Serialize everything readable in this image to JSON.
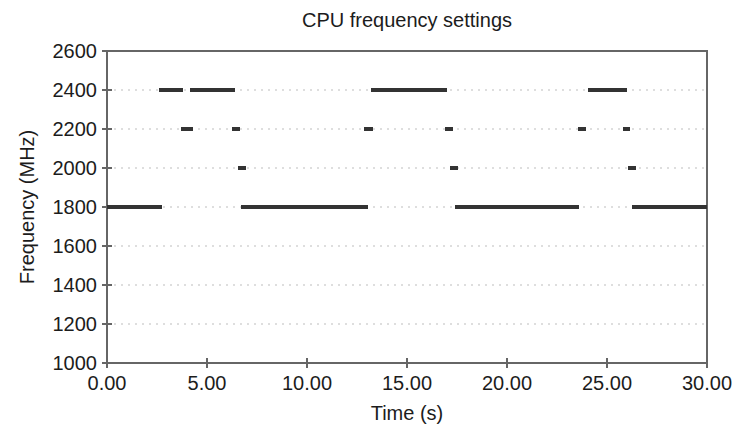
{
  "chart_data": {
    "type": "line",
    "title": "CPU frequency settings",
    "xlabel": "Time (s)",
    "ylabel": "Frequency (MHz)",
    "xlim": [
      0,
      30
    ],
    "ylim": [
      1000,
      2600
    ],
    "x_ticks": [
      0,
      5,
      10,
      15,
      20,
      25,
      30
    ],
    "x_tick_labels": [
      "0.00",
      "5.00",
      "10.00",
      "15.00",
      "20.00",
      "25.00",
      "30.00"
    ],
    "y_ticks": [
      1000,
      1200,
      1400,
      1600,
      1800,
      2000,
      2200,
      2400,
      2600
    ],
    "y_tick_labels": [
      "1000",
      "1200",
      "1400",
      "1600",
      "1800",
      "2000",
      "2200",
      "2400",
      "2600"
    ],
    "grid": true,
    "legend": false,
    "series": [
      {
        "name": "cpu-frequency-trace",
        "style": "horizontal-step-segments",
        "segments": [
          {
            "freq_mhz": 1800,
            "t": [
              0.0,
              2.75
            ]
          },
          {
            "freq_mhz": 2400,
            "t": [
              2.6,
              3.8
            ]
          },
          {
            "freq_mhz": 2200,
            "t": [
              3.7,
              4.3
            ]
          },
          {
            "freq_mhz": 2400,
            "t": [
              4.15,
              6.4
            ]
          },
          {
            "freq_mhz": 2200,
            "t": [
              6.25,
              6.65
            ]
          },
          {
            "freq_mhz": 2000,
            "t": [
              6.55,
              6.95
            ]
          },
          {
            "freq_mhz": 1800,
            "t": [
              6.7,
              13.05
            ]
          },
          {
            "freq_mhz": 2200,
            "t": [
              12.85,
              13.3
            ]
          },
          {
            "freq_mhz": 2400,
            "t": [
              13.2,
              17.0
            ]
          },
          {
            "freq_mhz": 2200,
            "t": [
              16.9,
              17.3
            ]
          },
          {
            "freq_mhz": 2000,
            "t": [
              17.15,
              17.55
            ]
          },
          {
            "freq_mhz": 1800,
            "t": [
              17.4,
              23.6
            ]
          },
          {
            "freq_mhz": 2200,
            "t": [
              23.55,
              23.95
            ]
          },
          {
            "freq_mhz": 2400,
            "t": [
              24.05,
              26.0
            ]
          },
          {
            "freq_mhz": 2200,
            "t": [
              25.8,
              26.15
            ]
          },
          {
            "freq_mhz": 2000,
            "t": [
              26.05,
              26.45
            ]
          },
          {
            "freq_mhz": 1800,
            "t": [
              26.25,
              30.0
            ]
          }
        ]
      }
    ],
    "colors": {
      "line": "#333333",
      "grid": "#d4d4d4",
      "border": "#666666",
      "text": "#1c1c1c",
      "background": "#ffffff"
    }
  }
}
